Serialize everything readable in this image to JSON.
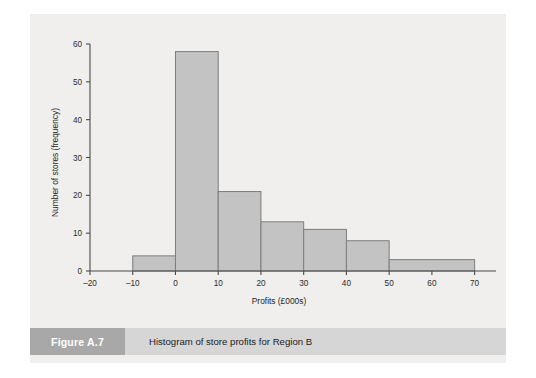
{
  "figure": {
    "label": "Figure A.7",
    "caption": "Histogram of store profits for Region B"
  },
  "colors": {
    "page_background": "#ffffff",
    "plot_background": "#f0efed",
    "bar_fill": "#c3c3c3",
    "bar_stroke": "#7d7d7d",
    "axis": "#4a4a4a",
    "caption_strip": "#d6d6d6",
    "figure_label_box": "#a8a8a8",
    "figure_label_text": "#ffffff"
  },
  "chart_data": {
    "type": "bar",
    "title": "Histogram of store profits for Region B",
    "xlabel": "Profits (£000s)",
    "ylabel": "Number of stores (frequency)",
    "xlim": [
      -20,
      75
    ],
    "ylim": [
      0,
      60
    ],
    "grid": false,
    "legend": "none",
    "xticks": [
      -20,
      -10,
      0,
      10,
      20,
      30,
      40,
      50,
      60,
      70
    ],
    "xtick_labels": [
      "–20",
      "–10",
      "0",
      "10",
      "20",
      "30",
      "40",
      "50",
      "60",
      "70"
    ],
    "yticks": [
      0,
      10,
      20,
      30,
      40,
      50,
      60
    ],
    "ytick_labels": [
      "0",
      "10",
      "20",
      "30",
      "40",
      "50",
      "60"
    ],
    "bins": [
      {
        "start": -10,
        "end": 0,
        "value": 4
      },
      {
        "start": 0,
        "end": 10,
        "value": 58
      },
      {
        "start": 10,
        "end": 20,
        "value": 21
      },
      {
        "start": 20,
        "end": 30,
        "value": 13
      },
      {
        "start": 30,
        "end": 40,
        "value": 11
      },
      {
        "start": 40,
        "end": 50,
        "value": 8
      },
      {
        "start": 50,
        "end": 70,
        "value": 3
      }
    ],
    "categories": [
      "-10 to 0",
      "0 to 10",
      "10 to 20",
      "20 to 30",
      "30 to 40",
      "40 to 50",
      "50 to 70"
    ],
    "values": [
      4,
      58,
      21,
      13,
      11,
      8,
      3
    ]
  }
}
